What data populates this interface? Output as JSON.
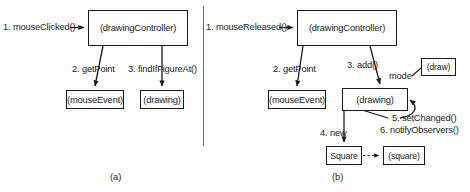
{
  "figure": {
    "divider": {
      "x": 203,
      "y": 6,
      "height": 140,
      "color": "#6e6e6e"
    },
    "line_color": "#1a1a1a",
    "background": "#ffffff"
  },
  "diagram_a": {
    "caption": "(a)",
    "nodes": [
      {
        "id": "drawingController",
        "label": "(drawingController)",
        "x": 88,
        "y": 10,
        "w": 100,
        "h": 36
      },
      {
        "id": "mouseEvent",
        "label": "(mouseEvent)",
        "x": 66,
        "y": 90,
        "w": 58,
        "h": 19
      },
      {
        "id": "drawing",
        "label": "(drawing)",
        "x": 140,
        "y": 90,
        "w": 44,
        "h": 19
      }
    ],
    "messages": [
      {
        "id": "m1",
        "label": "1. mouseClicked()",
        "x": 3,
        "y": 22
      },
      {
        "id": "m2",
        "label": "2. getPoint",
        "x": 72,
        "y": 64
      },
      {
        "id": "m3",
        "label": "3. findIfFigureAt()",
        "x": 128,
        "y": 64
      }
    ]
  },
  "diagram_b": {
    "caption": "(b)",
    "nodes": [
      {
        "id": "drawingController",
        "label": "(drawingController)",
        "x": 297,
        "y": 10,
        "w": 100,
        "h": 36
      },
      {
        "id": "mouseEvent",
        "label": "(mouseEvent)",
        "x": 268,
        "y": 90,
        "w": 58,
        "h": 19
      },
      {
        "id": "drawing",
        "label": "(drawing)",
        "x": 342,
        "y": 88,
        "w": 66,
        "h": 23
      },
      {
        "id": "draw",
        "label": "(draw)",
        "x": 421,
        "y": 58,
        "w": 35,
        "h": 18
      },
      {
        "id": "square_class",
        "label": "Square",
        "x": 326,
        "y": 146,
        "w": 36,
        "h": 19
      },
      {
        "id": "square_object",
        "label": "(square)",
        "x": 383,
        "y": 146,
        "w": 42,
        "h": 19
      }
    ],
    "messages": [
      {
        "id": "m1",
        "label": "1. mouseReleased()",
        "x": 206,
        "y": 22
      },
      {
        "id": "m2",
        "label": "2. getPoint",
        "x": 273,
        "y": 64
      },
      {
        "id": "m3",
        "label": "3. add()",
        "x": 347,
        "y": 60
      },
      {
        "id": "mode",
        "label": "mode",
        "x": 389,
        "y": 71
      },
      {
        "id": "m4",
        "label": "4. new",
        "x": 320,
        "y": 128
      },
      {
        "id": "m5",
        "label": "5. setChanged()",
        "x": 392,
        "y": 113
      },
      {
        "id": "m6",
        "label": "6. notifyObservers()",
        "x": 380,
        "y": 125
      }
    ]
  },
  "captions": {
    "a": {
      "label": "(a)",
      "x": 110,
      "y": 172
    },
    "b": {
      "label": "(b)",
      "x": 332,
      "y": 172
    }
  }
}
